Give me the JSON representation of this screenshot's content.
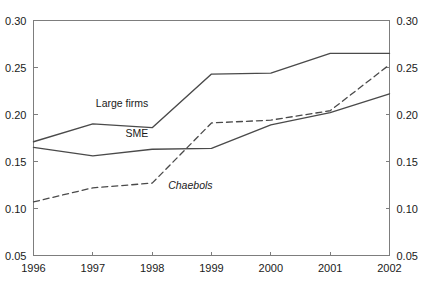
{
  "chart_data": {
    "type": "line",
    "title": "",
    "subtitle": "",
    "xlabel": "",
    "ylabel": "",
    "categories": [
      "1996",
      "1997",
      "1998",
      "1999",
      "2000",
      "2001",
      "2002"
    ],
    "x_tick_labels": [
      "1996",
      "1997",
      "1998",
      "1999",
      "2000",
      "2001",
      "2002"
    ],
    "y_tick_labels": [
      "0.05",
      "0.10",
      "0.15",
      "0.20",
      "0.25",
      "0.30"
    ],
    "y_tick_values": [
      0.05,
      0.1,
      0.15,
      0.2,
      0.25,
      0.3
    ],
    "ylim": [
      0.05,
      0.3
    ],
    "grid": false,
    "dual_y_axis": true,
    "legend_position": "inline-labels",
    "series": [
      {
        "name": "Large firms",
        "style": "solid",
        "color": "#4a4a4a",
        "values": [
          0.171,
          0.19,
          0.186,
          0.243,
          0.244,
          0.265,
          0.265
        ],
        "label_text": "Large firms",
        "label_x": 1997.05,
        "label_y": 0.2075
      },
      {
        "name": "SME",
        "style": "solid",
        "color": "#4a4a4a",
        "values": [
          0.165,
          0.156,
          0.163,
          0.164,
          0.189,
          0.202,
          0.222
        ],
        "label_text": "SME",
        "label_x": 1997.55,
        "label_y": 0.1765
      },
      {
        "name": "Chaebols",
        "style": "dashed",
        "color": "#4a4a4a",
        "values": [
          0.107,
          0.122,
          0.127,
          0.191,
          0.194,
          0.204,
          0.253
        ],
        "label_text": "Chaebols",
        "label_x": 1998.27,
        "label_y": 0.1205
      }
    ]
  }
}
